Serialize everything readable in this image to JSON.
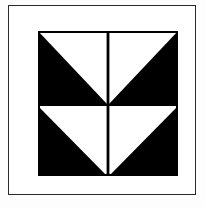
{
  "figure": {
    "caption": "",
    "background_color": "#fdfdfd",
    "frame_color": "#2b2b2f",
    "ink_color": "#000000",
    "paper_color": "#ffffff"
  },
  "motif": {
    "name": "four-quadrant-downward-triangles",
    "description": "Black square divided into four quadrants, each containing a white right triangle whose apex points down toward the bottom centre of the quadrant",
    "quadrant_count": 4,
    "quadrants": [
      {
        "position": "top-left",
        "shape": "white-right-triangle",
        "apex": "bottom-right"
      },
      {
        "position": "top-right",
        "shape": "white-right-triangle",
        "apex": "bottom-left"
      },
      {
        "position": "bottom-left",
        "shape": "white-right-triangle",
        "apex": "bottom-right"
      },
      {
        "position": "bottom-right",
        "shape": "white-right-triangle",
        "apex": "bottom-left"
      }
    ],
    "divider": {
      "vertical": true,
      "horizontal": false,
      "color": "#000000"
    }
  }
}
